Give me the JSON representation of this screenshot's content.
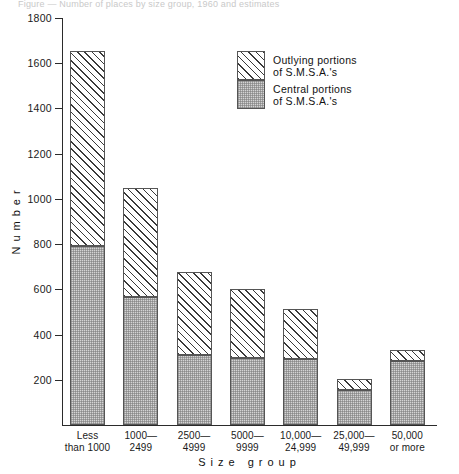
{
  "title_strip": "Figure — Number of places by size group, 1960 and estimates",
  "axes": {
    "ylabel": "Number",
    "xlabel": "Size group",
    "yticks": [
      200,
      400,
      600,
      800,
      1000,
      1200,
      1400,
      1600,
      1800
    ],
    "ymin": 0,
    "ymax": 1800
  },
  "legend": {
    "items": [
      {
        "swatch": "outlying-hatch-swatch",
        "line1": "Outlying portions",
        "line2": "of S.M.S.A.'s"
      },
      {
        "swatch": "central-stipple-swatch",
        "line1": "Central portions",
        "line2": "of S.M.S.A.'s"
      }
    ]
  },
  "xtick_labels": [
    {
      "line1": "Less",
      "line2": "than 1000"
    },
    {
      "line1": "1000—",
      "line2": "2499"
    },
    {
      "line1": "2500—",
      "line2": "4999"
    },
    {
      "line1": "5000—",
      "line2": "9999"
    },
    {
      "line1": "10,000—",
      "line2": "24,999"
    },
    {
      "line1": "25,000—",
      "line2": "49,999"
    },
    {
      "line1": "50,000",
      "line2": "or more"
    }
  ],
  "chart_data": {
    "type": "bar",
    "subtype": "stacked-vertical",
    "title": "",
    "xlabel": "Size group",
    "ylabel": "Number",
    "ylim": [
      0,
      1800
    ],
    "ytick_step": 200,
    "grid": false,
    "legend_position": "upper-right-inside",
    "categories": [
      "Less than 1000",
      "1000—2499",
      "2500—4999",
      "5000—9999",
      "10,000—24,999",
      "25,000—49,999",
      "50,000 or more"
    ],
    "series": [
      {
        "name": "Central portions of S.M.S.A.'s",
        "pattern": "light-grey-stipple",
        "color": "#d4d4d4",
        "values": [
          790,
          565,
          310,
          295,
          290,
          155,
          285
        ]
      },
      {
        "name": "Outlying portions of S.M.S.A.'s",
        "pattern": "diagonal-hatch",
        "color": "#ffffff",
        "values": [
          865,
          485,
          365,
          305,
          225,
          50,
          45
        ]
      }
    ],
    "totals": [
      1655,
      1050,
      675,
      600,
      515,
      205,
      330
    ]
  }
}
